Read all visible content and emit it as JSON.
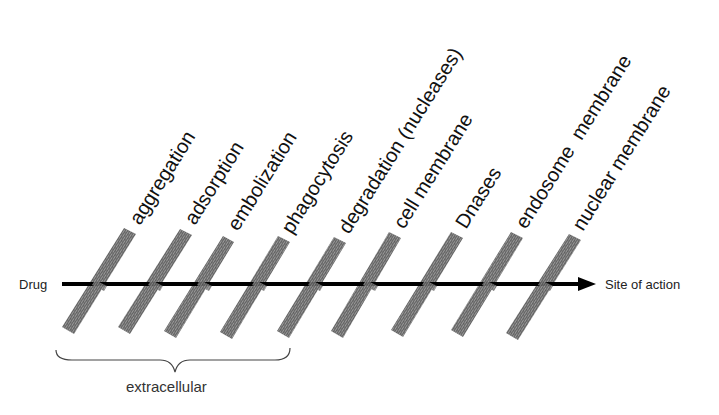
{
  "diagram": {
    "start_label": "Drug",
    "end_label": "Site of action",
    "group_label": "extracellular",
    "barriers": [
      {
        "label": "aggregation"
      },
      {
        "label": "adsorption"
      },
      {
        "label": "embolization"
      },
      {
        "label": "phagocytosis"
      },
      {
        "label": "degradation (nucleases)"
      },
      {
        "label": "cell membrane"
      },
      {
        "label": "Dnases"
      },
      {
        "label": "endosome  membrane"
      },
      {
        "label": "nuclear membrane"
      }
    ],
    "colors": {
      "arrow": "#000000",
      "barrier_fill": "#8a8a8a",
      "barrier_hatch": "#5a5a5a",
      "text": "#111111"
    }
  }
}
